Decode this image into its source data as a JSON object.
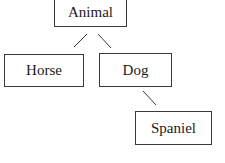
{
  "diagram": {
    "type": "tree",
    "nodes": [
      {
        "id": "animal",
        "label": "Animal",
        "x": 54,
        "y": -2,
        "w": 73,
        "h": 29
      },
      {
        "id": "horse",
        "label": "Horse",
        "x": 4,
        "y": 54,
        "w": 80,
        "h": 33
      },
      {
        "id": "dog",
        "label": "Dog",
        "x": 99,
        "y": 53,
        "w": 73,
        "h": 34
      },
      {
        "id": "spaniel",
        "label": "Spaniel",
        "x": 135,
        "y": 111,
        "w": 77,
        "h": 34
      }
    ],
    "edges": [
      {
        "from": "animal",
        "to": "horse",
        "x1": 87,
        "y1": 34,
        "x2": 74,
        "y2": 47
      },
      {
        "from": "animal",
        "to": "dog",
        "x1": 98,
        "y1": 34,
        "x2": 111,
        "y2": 48
      },
      {
        "from": "dog",
        "to": "spaniel",
        "x1": 143,
        "y1": 91,
        "x2": 156,
        "y2": 105
      }
    ]
  }
}
